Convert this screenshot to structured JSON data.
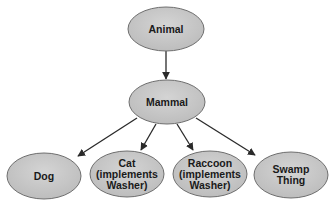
{
  "diagram": {
    "type": "class-hierarchy",
    "colors": {
      "node_fill": "#c6c6c6",
      "node_stroke": "#6e6e6e",
      "edge": "#2a2a2a",
      "text": "#1a1a1a"
    },
    "nodes": [
      {
        "id": "animal",
        "lines": [
          "Animal"
        ],
        "cx": 166,
        "cy": 29,
        "rx": 38,
        "ry": 22
      },
      {
        "id": "mammal",
        "lines": [
          "Mammal"
        ],
        "cx": 167,
        "cy": 102,
        "rx": 38,
        "ry": 22
      },
      {
        "id": "dog",
        "lines": [
          "Dog"
        ],
        "cx": 44,
        "cy": 176,
        "rx": 37,
        "ry": 23
      },
      {
        "id": "cat",
        "lines": [
          "Cat",
          "(implements",
          "Washer)"
        ],
        "cx": 127,
        "cy": 174,
        "rx": 37,
        "ry": 23
      },
      {
        "id": "raccoon",
        "lines": [
          "Raccoon",
          "(implements",
          "Washer)"
        ],
        "cx": 210,
        "cy": 174,
        "rx": 37,
        "ry": 23
      },
      {
        "id": "swamp-thing",
        "lines": [
          "Swamp",
          "Thing"
        ],
        "cx": 291,
        "cy": 175,
        "rx": 37,
        "ry": 23
      }
    ],
    "edges": [
      {
        "from": "animal",
        "to": "mammal",
        "x1": 166,
        "y1": 51,
        "x2": 166,
        "y2": 79
      },
      {
        "from": "mammal",
        "to": "dog",
        "x1": 137,
        "y1": 118,
        "x2": 78,
        "y2": 156
      },
      {
        "from": "mammal",
        "to": "cat",
        "x1": 156,
        "y1": 124,
        "x2": 141,
        "y2": 150
      },
      {
        "from": "mammal",
        "to": "raccoon",
        "x1": 177,
        "y1": 124,
        "x2": 193,
        "y2": 150
      },
      {
        "from": "mammal",
        "to": "swamp-thing",
        "x1": 196,
        "y1": 118,
        "x2": 255,
        "y2": 155
      }
    ]
  }
}
